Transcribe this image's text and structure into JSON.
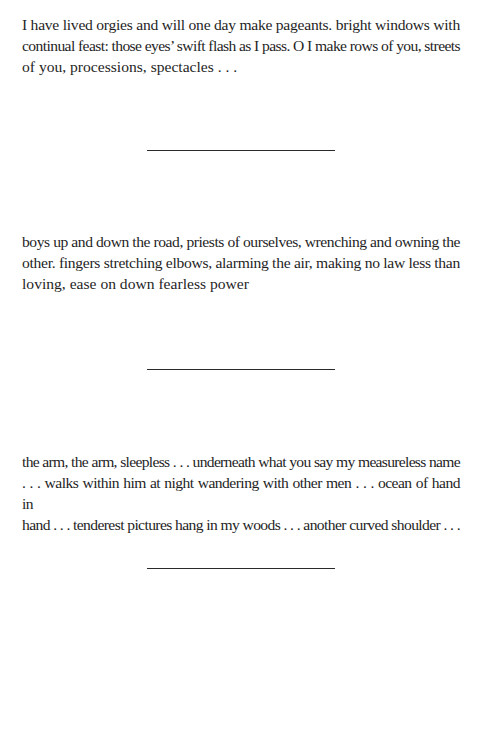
{
  "stanzas": [
    {
      "lines": [
        "I have lived orgies and will one day make pageants. bright windows with",
        "continual feast: those eyes’ swift flash as I pass. O I make rows of you, streets",
        "of you, processions, spectacles . . ."
      ]
    },
    {
      "lines": [
        "boys up and down the road, priests of ourselves, wrenching and owning the",
        "other. fingers stretching elbows, alarming the air, making no law less than",
        "loving, ease on down fearless power"
      ]
    },
    {
      "lines": [
        "the arm, the arm, sleepless . . . underneath what you say my measureless name",
        ". . . walks within him at night wandering with other men . . . ocean of hand in",
        "hand . . . tenderest pictures hang in my woods . . . another curved shoulder . . ."
      ]
    }
  ],
  "dividers": [
    {
      "style": "horizontal-rule"
    },
    {
      "style": "horizontal-rule"
    },
    {
      "style": "horizontal-rule"
    }
  ]
}
